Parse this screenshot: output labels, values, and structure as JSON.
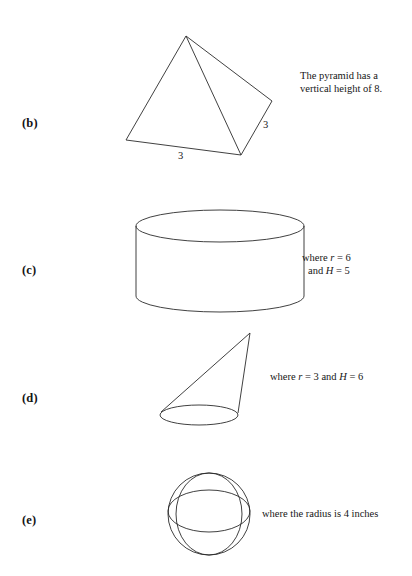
{
  "document": {
    "type": "math-worksheet-figures",
    "background_color": "#ffffff",
    "ink_color": "#2b2b2b"
  },
  "items": [
    {
      "id": "b",
      "label": "(b)",
      "shape": "pyramid",
      "note_lines": [
        "The pyramid has a",
        "vertical height of 8."
      ],
      "dimensions": [
        {
          "name": "base-edge",
          "value": "3"
        },
        {
          "name": "lateral-edge",
          "value": "3"
        }
      ]
    },
    {
      "id": "c",
      "label": "(c)",
      "shape": "cylinder",
      "note_lines": [
        "where r  =  6",
        "and H  =  5"
      ],
      "note_parts": {
        "line1": {
          "where": "where",
          "var": "r",
          "eq": "=",
          "value": "6"
        },
        "line2": {
          "and": "and",
          "var": "H",
          "eq": "=",
          "value": "5"
        }
      }
    },
    {
      "id": "d",
      "label": "(d)",
      "shape": "cone",
      "note_lines": [
        "where r  =  3 and H  =  6"
      ],
      "note_parts": {
        "where": "where",
        "var1": "r",
        "eq1": "=",
        "value1": "3",
        "and": "and",
        "var2": "H",
        "eq2": "=",
        "value2": "6"
      }
    },
    {
      "id": "e",
      "label": "(e)",
      "shape": "sphere",
      "note_lines": [
        "where the radius is 4 inches"
      ]
    }
  ],
  "labels": {
    "b": "(b)",
    "c": "(c)",
    "d": "(d)",
    "e": "(e)"
  },
  "pyramid": {
    "note_line1": "The pyramid has a",
    "note_line2": "vertical height of 8.",
    "base_dim": "3",
    "edge_dim": "3"
  },
  "cylinder": {
    "note_where": "where",
    "note_r": "r",
    "note_r_eq": "=",
    "note_r_val": "6",
    "note_and": "and",
    "note_h": "H",
    "note_h_eq": "=",
    "note_h_val": "5"
  },
  "cone": {
    "note_where": "where",
    "note_r": "r",
    "note_r_eq": "=",
    "note_r_val": "3",
    "note_and": "and",
    "note_h": "H",
    "note_h_eq": "=",
    "note_h_val": "6"
  },
  "sphere": {
    "note": "where the radius is 4 inches"
  }
}
